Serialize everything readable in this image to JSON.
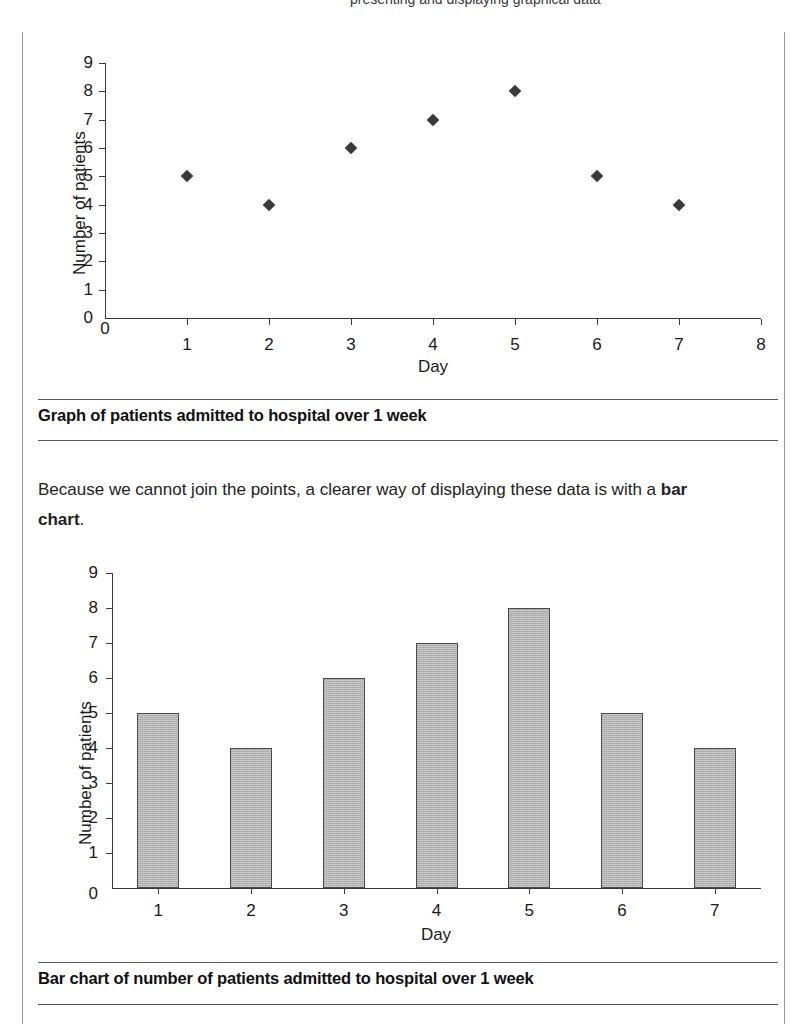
{
  "page": {
    "top_clipped_text": "presenting and displaying graphical data"
  },
  "figure1": {
    "caption": "Graph of patients admitted to hospital over 1 week",
    "ylabel": "Number of patients",
    "xlabel": "Day",
    "yticks": [
      "0",
      "1",
      "2",
      "3",
      "4",
      "5",
      "6",
      "7",
      "8",
      "9"
    ],
    "xticks": [
      "0",
      "1",
      "2",
      "3",
      "4",
      "5",
      "6",
      "7",
      "8"
    ]
  },
  "paragraph": {
    "text_before": "Because we cannot join the points, a clearer way of displaying these data is with a ",
    "bold_term": "bar chart",
    "text_after": "."
  },
  "figure2": {
    "caption": "Bar chart of number of patients admitted to hospital over 1 week",
    "ylabel": "Number of patients",
    "xlabel": "Day",
    "yticks": [
      "0",
      "1",
      "2",
      "3",
      "4",
      "5",
      "6",
      "7",
      "8",
      "9"
    ],
    "xticks": [
      "1",
      "2",
      "3",
      "4",
      "5",
      "6",
      "7"
    ]
  },
  "chart_data": [
    {
      "type": "scatter",
      "title": "Graph of patients admitted to hospital over 1 week",
      "xlabel": "Day",
      "ylabel": "Number of patients",
      "x": [
        1,
        2,
        3,
        4,
        5,
        6,
        7
      ],
      "values": [
        5,
        4,
        6,
        7,
        8,
        5,
        4
      ],
      "xlim": [
        0,
        8
      ],
      "ylim": [
        0,
        9
      ],
      "xticks": [
        0,
        1,
        2,
        3,
        4,
        5,
        6,
        7,
        8
      ],
      "yticks": [
        0,
        1,
        2,
        3,
        4,
        5,
        6,
        7,
        8,
        9
      ],
      "marker": "diamond",
      "marker_color": "#3a3a3a",
      "grid": false,
      "legend": false
    },
    {
      "type": "bar",
      "title": "Bar chart of number of patients admitted to hospital over 1 week",
      "xlabel": "Day",
      "ylabel": "Number of patients",
      "categories": [
        "1",
        "2",
        "3",
        "4",
        "5",
        "6",
        "7"
      ],
      "values": [
        5,
        4,
        6,
        7,
        8,
        5,
        4
      ],
      "ylim": [
        0,
        9
      ],
      "yticks": [
        0,
        1,
        2,
        3,
        4,
        5,
        6,
        7,
        8,
        9
      ],
      "bar_fill": "#b4b4b4",
      "bar_edge": "#4b4b4b",
      "grid": false,
      "legend": false
    }
  ]
}
